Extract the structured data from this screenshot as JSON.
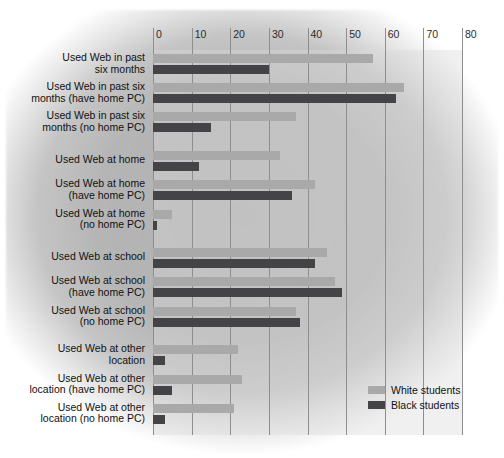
{
  "chart_data": {
    "type": "bar",
    "orientation": "horizontal",
    "title": "",
    "xlabel": "",
    "ylabel": "",
    "xlim": [
      0,
      80
    ],
    "xticks": [
      0,
      10,
      20,
      30,
      40,
      50,
      60,
      70,
      80
    ],
    "xtick_labels": [
      "0",
      "10",
      "20",
      "30",
      "40",
      "50",
      "60",
      "70",
      "80"
    ],
    "grid": "vertical",
    "legend_position": "bottom-right",
    "colors": {
      "white_students": "#a9a9a9",
      "black_students": "#444446",
      "gridline": "#8e8e8e",
      "plot_background": "#d6d6d6",
      "page_background": "#ffffff"
    },
    "categories": [
      "Used Web in past six months",
      "Used Web in past six months (have home PC)",
      "Used Web in past six months (no home PC)",
      "Used Web at home",
      "Used Web at home (have home PC)",
      "Used Web at home (no home PC)",
      "Used Web at school",
      "Used Web at school (have home PC)",
      "Used Web at school (no home PC)",
      "Used Web at other location",
      "Used Web at other location (have home PC)",
      "Used Web at other location (no home PC)"
    ],
    "series": [
      {
        "name": "White students",
        "color": "#a9a9a9",
        "values": [
          57,
          65,
          37,
          33,
          42,
          5,
          45,
          47,
          37,
          22,
          23,
          21
        ]
      },
      {
        "name": "Black students",
        "color": "#444446",
        "values": [
          30,
          63,
          15,
          12,
          36,
          1,
          42,
          49,
          38,
          3,
          5,
          3
        ]
      }
    ]
  },
  "rows": [
    {
      "label_lines": [
        "Used Web in past",
        "six months"
      ],
      "white": 57,
      "black": 30,
      "gap_before": 0
    },
    {
      "label_lines": [
        "Used Web in past six",
        "months (have home PC)"
      ],
      "white": 65,
      "black": 63,
      "gap_before": 0
    },
    {
      "label_lines": [
        "Used Web in past six",
        "months (no home PC)"
      ],
      "white": 37,
      "black": 15,
      "gap_before": 0
    },
    {
      "label_lines": [
        "Used Web at home"
      ],
      "white": 33,
      "black": 12,
      "gap_before": 1
    },
    {
      "label_lines": [
        "Used Web at home",
        "(have home PC)"
      ],
      "white": 42,
      "black": 36,
      "gap_before": 0
    },
    {
      "label_lines": [
        "Used Web at home",
        "(no home PC)"
      ],
      "white": 5,
      "black": 1,
      "gap_before": 0
    },
    {
      "label_lines": [
        "Used Web at school"
      ],
      "white": 45,
      "black": 42,
      "gap_before": 1
    },
    {
      "label_lines": [
        "Used Web at school",
        "(have home PC)"
      ],
      "white": 47,
      "black": 49,
      "gap_before": 0
    },
    {
      "label_lines": [
        "Used Web at school",
        "(no home PC)"
      ],
      "white": 37,
      "black": 38,
      "gap_before": 0
    },
    {
      "label_lines": [
        "Used Web at other",
        "location"
      ],
      "white": 22,
      "black": 3,
      "gap_before": 1
    },
    {
      "label_lines": [
        "Used Web at other",
        "location (have home PC)"
      ],
      "white": 23,
      "black": 5,
      "gap_before": 0
    },
    {
      "label_lines": [
        "Used Web at other",
        "location (no home PC)"
      ],
      "white": 21,
      "black": 3,
      "gap_before": 0
    }
  ],
  "legend": {
    "items": [
      {
        "label": "White students",
        "swatch": "white"
      },
      {
        "label": "Black students",
        "swatch": "black"
      }
    ]
  }
}
